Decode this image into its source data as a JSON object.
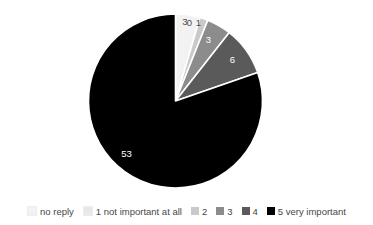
{
  "chart_data": {
    "type": "pie",
    "title": "",
    "subtitle": "",
    "xlabel": "",
    "ylabel": "",
    "grid": false,
    "legend_position": "bottom",
    "start_angle_deg": 0,
    "direction": "clockwise",
    "total": 66,
    "categories": [
      "no reply",
      "1 not important at all",
      "2",
      "3",
      "4",
      "5 very important"
    ],
    "values": [
      3,
      0,
      1,
      3,
      6,
      53
    ],
    "data_labels": [
      "3",
      "0",
      "1",
      "3",
      "6",
      "53"
    ],
    "colors": [
      "#f2f2f2",
      "#e0e0e0",
      "#c9c9c9",
      "#8c8c8c",
      "#5a5a5a",
      "#000000"
    ],
    "label_text_colors": [
      "#4a4a4a",
      "#4a4a4a",
      "#4a4a4a",
      "#ffffff",
      "#ffffff",
      "#ffffff"
    ],
    "slice_border_color": "#ffffff",
    "slices": [
      {
        "name": "no reply",
        "value": 3,
        "label": "3",
        "color": "#f2f2f2"
      },
      {
        "name": "1 not important at all",
        "value": 0,
        "label": "0",
        "color": "#e0e0e0"
      },
      {
        "name": "2",
        "value": 1,
        "label": "1",
        "color": "#c9c9c9"
      },
      {
        "name": "3",
        "value": 3,
        "label": "3",
        "color": "#8c8c8c"
      },
      {
        "name": "4",
        "value": 6,
        "label": "6",
        "color": "#5a5a5a"
      },
      {
        "name": "5 very important",
        "value": 53,
        "label": "53",
        "color": "#000000"
      }
    ]
  },
  "legend": {
    "items": [
      {
        "label": "no reply",
        "color": "#f2f2f2"
      },
      {
        "label": "1 not important at all",
        "color": "#e8e8e8"
      },
      {
        "label": "2",
        "color": "#c9c9c9"
      },
      {
        "label": "3",
        "color": "#8c8c8c"
      },
      {
        "label": "4",
        "color": "#5a5a5a"
      },
      {
        "label": "5 very important",
        "color": "#000000"
      }
    ]
  },
  "labels": {
    "slice_0": "3",
    "slice_1": "0",
    "slice_2": "1",
    "slice_3": "3",
    "slice_4": "6",
    "slice_5": "53"
  }
}
